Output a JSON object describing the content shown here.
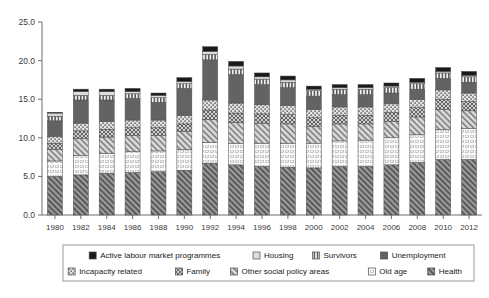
{
  "chart_data": {
    "type": "bar",
    "stacked": true,
    "title": "",
    "subtitle": "",
    "xlabel": "",
    "ylabel": "",
    "ylim": [
      0.0,
      25.0
    ],
    "ytick_labels": [
      "0.0",
      "5.0",
      "10.0",
      "15.0",
      "20.0",
      "25.0"
    ],
    "ytick_values": [
      0.0,
      5.0,
      10.0,
      15.0,
      20.0,
      25.0
    ],
    "grid": false,
    "legend_position": "bottom",
    "categories": [
      "1980",
      "1982",
      "1984",
      "1986",
      "1988",
      "1990",
      "1992",
      "1994",
      "1996",
      "1998",
      "2000",
      "2002",
      "2004",
      "2006",
      "2008",
      "2010",
      "2012"
    ],
    "series": [
      {
        "name": "Health",
        "pattern": "diagonal-hatch-dark",
        "color": "#8a8a8a",
        "values": [
          5.0,
          5.2,
          5.4,
          5.5,
          5.6,
          5.8,
          6.7,
          6.5,
          6.3,
          6.2,
          6.1,
          6.3,
          6.3,
          6.5,
          6.8,
          7.2,
          7.2
        ]
      },
      {
        "name": "Old age",
        "pattern": "dotted-light",
        "color": "#f2f2f2",
        "values": [
          2.0,
          2.5,
          2.6,
          2.7,
          2.7,
          2.7,
          2.7,
          2.8,
          3.0,
          3.1,
          3.2,
          3.3,
          3.4,
          3.5,
          3.6,
          3.9,
          4.0
        ]
      },
      {
        "name": "Other social policy areas",
        "pattern": "diagonal-hatch-light",
        "color": "#c9c9c9",
        "values": [
          1.5,
          2.2,
          2.1,
          2.1,
          2.0,
          2.3,
          3.0,
          2.7,
          2.6,
          2.5,
          2.2,
          2.2,
          2.1,
          2.1,
          2.3,
          2.6,
          2.3
        ]
      },
      {
        "name": "Family",
        "pattern": "crosshatch",
        "color": "#b4b4b4",
        "values": [
          0.8,
          1.0,
          1.0,
          1.0,
          1.0,
          1.0,
          1.2,
          1.2,
          1.2,
          1.2,
          1.1,
          1.1,
          1.1,
          1.2,
          1.2,
          1.3,
          1.2
        ]
      },
      {
        "name": "Incapacity related",
        "pattern": "dotted-mid",
        "color": "#d6d6d6",
        "values": [
          0.9,
          1.0,
          1.0,
          1.0,
          1.0,
          1.1,
          1.3,
          1.3,
          1.2,
          1.2,
          1.1,
          1.1,
          1.1,
          1.1,
          1.1,
          1.2,
          1.1
        ]
      },
      {
        "name": "Unemployment",
        "pattern": "solid-dark",
        "color": "#636363",
        "values": [
          2.0,
          3.0,
          2.8,
          2.8,
          2.3,
          3.5,
          5.2,
          3.7,
          2.6,
          2.3,
          1.7,
          1.6,
          1.6,
          1.4,
          1.3,
          1.5,
          1.4
        ]
      },
      {
        "name": "Survivors",
        "pattern": "vertical-lines",
        "color": "#8f8f8f",
        "values": [
          0.6,
          0.6,
          0.6,
          0.6,
          0.6,
          0.6,
          0.7,
          0.7,
          0.7,
          0.7,
          0.7,
          0.7,
          0.7,
          0.7,
          0.7,
          0.7,
          0.7
        ]
      },
      {
        "name": "Housing",
        "pattern": "light-solid",
        "color": "#dcdcdc",
        "values": [
          0.4,
          0.5,
          0.5,
          0.3,
          0.3,
          0.3,
          0.4,
          0.4,
          0.3,
          0.3,
          0.2,
          0.2,
          0.2,
          0.2,
          0.2,
          0.2,
          0.2
        ]
      },
      {
        "name": "Active labour market programmes",
        "pattern": "solid-black",
        "color": "#1a1a1a",
        "values": [
          0.1,
          0.3,
          0.3,
          0.4,
          0.3,
          0.5,
          0.6,
          0.6,
          0.5,
          0.5,
          0.4,
          0.4,
          0.4,
          0.4,
          0.5,
          0.5,
          0.5
        ]
      }
    ],
    "totals": [
      13.3,
      16.3,
      16.3,
      16.4,
      15.8,
      17.8,
      21.8,
      19.9,
      18.4,
      18.0,
      16.7,
      16.9,
      16.9,
      17.1,
      17.7,
      19.1,
      18.6
    ]
  },
  "legend": {
    "row1": [
      {
        "label": "Active labour market programmes",
        "pattern": "solid-black"
      },
      {
        "label": "Housing",
        "pattern": "light-solid"
      },
      {
        "label": "Survivors",
        "pattern": "vertical-lines"
      },
      {
        "label": "Unemployment",
        "pattern": "solid-dark"
      }
    ],
    "row2": [
      {
        "label": "Incapacity related",
        "pattern": "dotted-mid"
      },
      {
        "label": "Family",
        "pattern": "crosshatch"
      },
      {
        "label": "Other social policy areas",
        "pattern": "diagonal-hatch-light"
      },
      {
        "label": "Old age",
        "pattern": "dotted-light"
      },
      {
        "label": "Health",
        "pattern": "diagonal-hatch-dark"
      }
    ]
  }
}
